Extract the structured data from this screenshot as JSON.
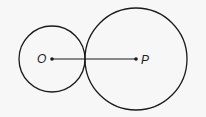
{
  "diagram": {
    "type": "geometry",
    "background": "#f7f7f7",
    "stroke_color": "#1a1a1a",
    "points": {
      "O": {
        "label": "O",
        "x": 52,
        "y": 59
      },
      "P": {
        "label": "P",
        "x": 136,
        "y": 59
      }
    },
    "circles": [
      {
        "name": "small-circle",
        "center": "O",
        "cx": 52,
        "cy": 59,
        "r": 33
      },
      {
        "name": "large-circle",
        "center": "P",
        "cx": 136,
        "cy": 59,
        "r": 51
      }
    ],
    "segments": [
      {
        "name": "segment-OP",
        "from": "O",
        "to": "P"
      }
    ]
  }
}
